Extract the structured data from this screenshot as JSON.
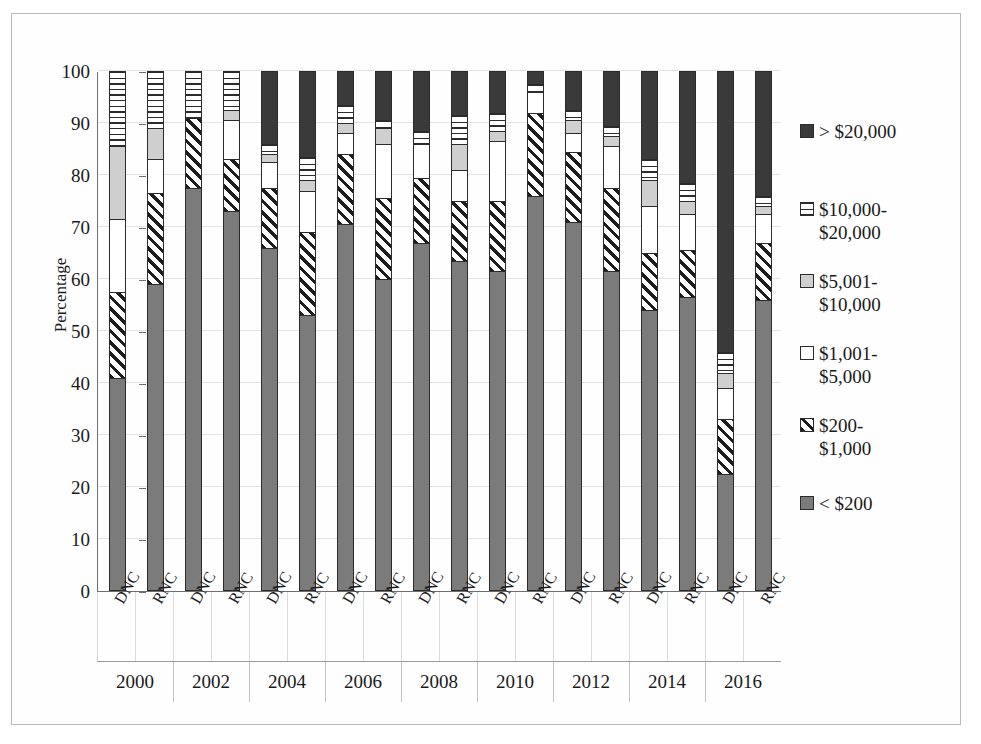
{
  "chart_data": {
    "type": "bar",
    "subtype": "stacked-bar-100-percent",
    "title": "",
    "xlabel": "",
    "ylabel": "Percentage",
    "ylim": [
      0,
      100
    ],
    "yticks": [
      0,
      10,
      20,
      30,
      40,
      50,
      60,
      70,
      80,
      90,
      100
    ],
    "grid": true,
    "legend_position": "right",
    "categories": [
      "2000 DNC",
      "2000 RNC",
      "2002 DNC",
      "2002 RNC",
      "2004 DNC",
      "2004 RNC",
      "2006 DNC",
      "2006 RNC",
      "2008 DNC",
      "2008 RNC",
      "2010 DNC",
      "2010 RNC",
      "2012 DNC",
      "2012 RNC",
      "2014 DNC",
      "2014 RNC",
      "2016 DNC",
      "2016 RNC"
    ],
    "group_labels": [
      "2000",
      "2002",
      "2004",
      "2006",
      "2008",
      "2010",
      "2012",
      "2014",
      "2016"
    ],
    "tick_labels": [
      "DNC",
      "RNC",
      "DNC",
      "RNC",
      "DNC",
      "RNC",
      "DNC",
      "RNC",
      "DNC",
      "RNC",
      "DNC",
      "RNC",
      "DNC",
      "RNC",
      "DNC",
      "RNC",
      "DNC",
      "RNC"
    ],
    "series": [
      {
        "name": "< $200",
        "pattern": "solid-mid-gray",
        "color": "#7b7b7b",
        "values": [
          41.0,
          59.0,
          77.5,
          73.0,
          66.0,
          53.0,
          70.5,
          60.0,
          67.0,
          63.5,
          61.5,
          76.0,
          71.0,
          61.5,
          54.0,
          56.5,
          22.5,
          56.0
        ]
      },
      {
        "name": "$200-$1,000",
        "pattern": "diagonal-hatch",
        "color": "#ffffff",
        "values": [
          16.5,
          17.5,
          13.5,
          10.0,
          11.5,
          16.0,
          13.5,
          15.5,
          12.5,
          11.5,
          13.5,
          16.0,
          13.5,
          16.0,
          11.0,
          9.0,
          10.5,
          11.0
        ]
      },
      {
        "name": "$1,001-$5,000",
        "pattern": "solid-white",
        "color": "#ffffff",
        "values": [
          14.0,
          6.5,
          0.0,
          7.5,
          5.0,
          8.0,
          4.0,
          10.5,
          6.5,
          6.0,
          11.5,
          4.0,
          3.5,
          8.0,
          9.0,
          7.0,
          6.0,
          5.5
        ]
      },
      {
        "name": "$5,001-$10,000",
        "pattern": "solid-light-gray",
        "color": "#cfcfcf",
        "values": [
          14.0,
          6.0,
          0.0,
          2.0,
          1.5,
          2.0,
          2.0,
          3.0,
          0.0,
          5.0,
          2.0,
          0.0,
          2.5,
          2.0,
          5.0,
          2.5,
          3.0,
          1.5
        ]
      },
      {
        "name": "$10,000-$20,000",
        "pattern": "horizontal-stripe",
        "color": "#ffffff",
        "values": [
          14.5,
          11.0,
          9.0,
          7.5,
          2.0,
          4.5,
          3.5,
          1.5,
          2.5,
          5.5,
          3.5,
          1.5,
          2.0,
          2.0,
          4.0,
          3.5,
          4.0,
          2.0
        ]
      },
      {
        "name": "> $20,000",
        "pattern": "solid-dark",
        "color": "#3a3a3a",
        "values": [
          0.0,
          0.0,
          0.0,
          0.0,
          14.0,
          16.5,
          6.5,
          9.5,
          11.5,
          8.5,
          8.0,
          2.5,
          7.5,
          10.5,
          17.0,
          21.5,
          54.0,
          24.0
        ]
      }
    ],
    "legend": [
      {
        "label": "> $20,000",
        "swatch": "solid-dark"
      },
      {
        "label": "$10,000-\n$20,000",
        "swatch": "horizontal-stripe"
      },
      {
        "label": "$5,001-\n$10,000",
        "swatch": "solid-light-gray"
      },
      {
        "label": "$1,001-\n$5,000",
        "swatch": "solid-white"
      },
      {
        "label": "$200-\n$1,000",
        "swatch": "diagonal-hatch"
      },
      {
        "label": "< $200",
        "swatch": "solid-mid-gray"
      }
    ]
  },
  "colors": {
    "dark": "#3a3a3a",
    "mid_gray": "#7b7b7b",
    "light_gray": "#cfcfcf",
    "white": "#ffffff",
    "outline": "#2b2b2b",
    "grid": "#e3e3e3",
    "axis": "#6f6f6f"
  }
}
